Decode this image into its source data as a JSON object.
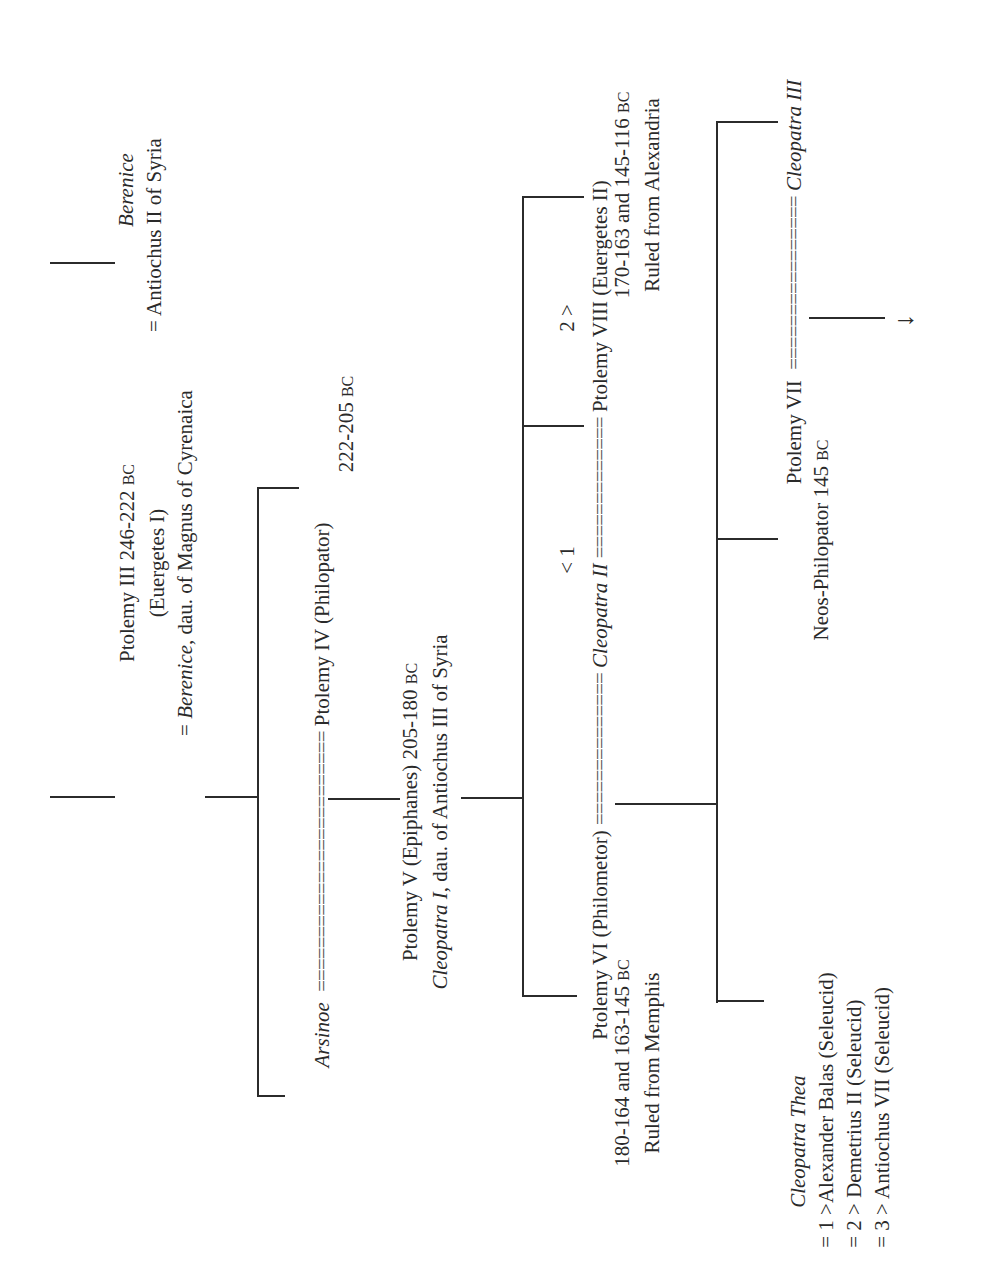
{
  "diagram": {
    "type": "family-tree",
    "orientation": "rotated-90-ccw",
    "nodes": {
      "berenice_syria": {
        "name": "Berenice",
        "spouse": "= Antiochus II of Syria"
      },
      "ptolemy_iii": {
        "line1": "Ptolemy III 246-222",
        "era": "BC",
        "line2": "(Euergetes I)",
        "spouse_prefix": "= ",
        "spouse_name": "Berenice",
        "spouse_rest": ", dau. of Magnus of Cyrenaica"
      },
      "arsinoe": {
        "name": "Arsinoe"
      },
      "marriage_1": {
        "eq": "========================"
      },
      "ptolemy_iv": {
        "line1": "Ptolemy IV (Philopator)",
        "line2": "222-205",
        "era": "BC"
      },
      "ptolemy_v": {
        "line1": "Ptolemy V (Epiphanes) 205-180",
        "era": "BC",
        "spouse_name": "Cleopatra I",
        "spouse_rest": ", dau. of Antiochus III of Syria"
      },
      "ptolemy_vi": {
        "line1": "Ptolemy VI (Philometor)",
        "line2": "180-164 and 163-145",
        "era": "BC",
        "line3": "Ruled from Memphis"
      },
      "marriage_2": {
        "eq": "=============="
      },
      "marker_1": "< 1",
      "cleopatra_ii": {
        "name": "Cleopatra II"
      },
      "marker_2": "2 >",
      "marriage_3": {
        "eq": "============="
      },
      "ptolemy_viii": {
        "line1": "Ptolemy VIII (Euergetes II)",
        "line2": "170-163 and 145-116",
        "era": "BC",
        "line3": "Ruled from Alexandria"
      },
      "cleopatra_thea": {
        "name": "Cleopatra Thea",
        "spouses": [
          "= 1 >Alexander Balas (Seleucid)",
          "= 2 > Demetrius II (Seleucid)",
          "= 3 > Antiochus VII (Seleucid)"
        ]
      },
      "ptolemy_vii": {
        "line1": "Ptolemy VII",
        "marriage_eq": "================",
        "line2": "Neos-Philopator 145",
        "era": "BC"
      },
      "cleopatra_iii": {
        "name": "Cleopatra III"
      },
      "continuation": {
        "arrow": "→"
      }
    }
  }
}
